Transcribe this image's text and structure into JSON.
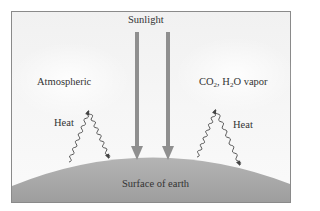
{
  "diagram": {
    "title_label": "Sunlight",
    "left_label": "Atmospheric",
    "right_label_parts": {
      "co": "CO",
      "co_sub": "2",
      "h": ", H",
      "h_sub": "2",
      "rest": "O vapor"
    },
    "heat_left": "Heat",
    "heat_right": "Heat",
    "ground_label": "Surface of earth",
    "colors": {
      "arrow": "#8f8f8f",
      "ground": "#a9a9a9",
      "sky": "#f3f3f3",
      "border": "#8a8a8a",
      "wave": "#444444"
    }
  }
}
